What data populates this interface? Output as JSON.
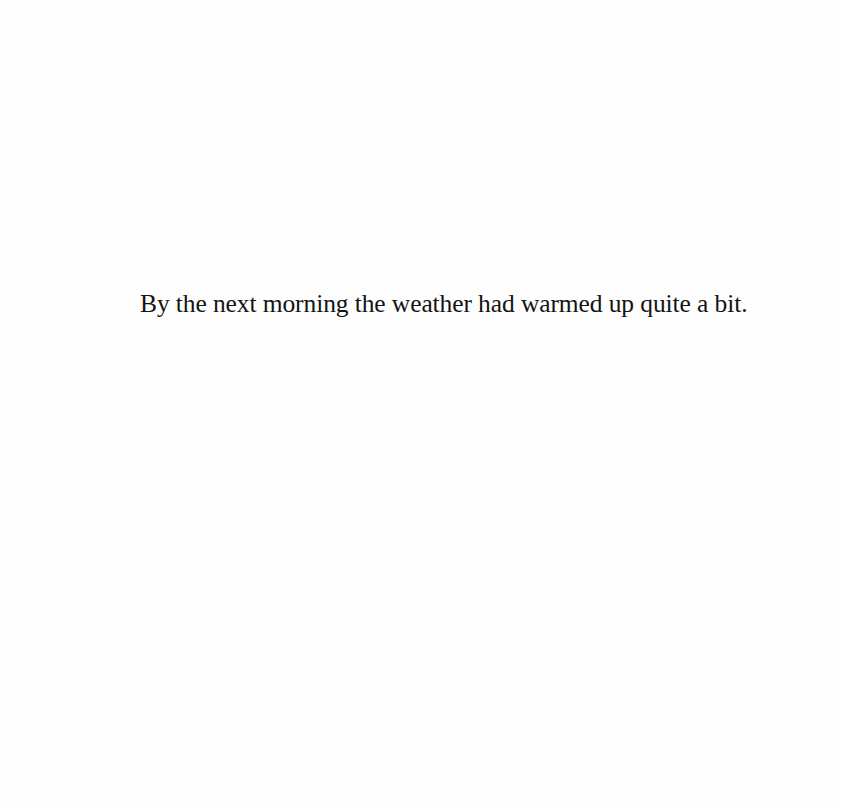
{
  "page": {
    "background_color": "#fefefe",
    "text_color": "#141414",
    "body_text": "By the next morning the weather had warmed up quite a bit."
  }
}
